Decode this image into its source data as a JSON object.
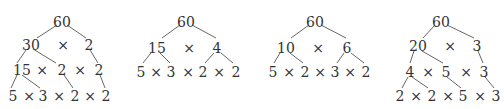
{
  "diagram": {
    "title": "",
    "colors": {
      "text": "#333333",
      "lines": "#555555",
      "background": "#ffffff"
    },
    "times_symbol": "×",
    "trees": [
      {
        "root": {
          "label": "60",
          "x": 62,
          "y": 22
        },
        "rows": [
          {
            "y": 45,
            "items": [
              {
                "t": "30",
                "x": 31
              },
              {
                "t": "×",
                "x": 63,
                "op": true
              },
              {
                "t": "2",
                "x": 89
              }
            ]
          },
          {
            "y": 70,
            "items": [
              {
                "t": "15",
                "x": 22
              },
              {
                "t": "×",
                "x": 42,
                "op": true
              },
              {
                "t": "2",
                "x": 62
              },
              {
                "t": "×",
                "x": 80,
                "op": true
              },
              {
                "t": "2",
                "x": 99
              }
            ]
          },
          {
            "y": 96,
            "items": [
              {
                "t": "5",
                "x": 13
              },
              {
                "t": "×",
                "x": 29,
                "op": true
              },
              {
                "t": "3",
                "x": 43
              },
              {
                "t": "×",
                "x": 59,
                "op": true
              },
              {
                "t": "2",
                "x": 75
              },
              {
                "t": "×",
                "x": 90,
                "op": true
              },
              {
                "t": "2",
                "x": 106
              }
            ]
          }
        ],
        "edges": [
          [
            57,
            25,
            37,
            38
          ],
          [
            67,
            25,
            86,
            38
          ],
          [
            26,
            50,
            17,
            63
          ],
          [
            33,
            49,
            56,
            63
          ],
          [
            90,
            50,
            98,
            63
          ],
          [
            17,
            75,
            11,
            88
          ],
          [
            22,
            75,
            40,
            88
          ],
          [
            64,
            75,
            73,
            88
          ],
          [
            100,
            75,
            105,
            88
          ]
        ]
      },
      {
        "root": {
          "label": "60",
          "x": 186,
          "y": 22
        },
        "rows": [
          {
            "y": 48,
            "items": [
              {
                "t": "15",
                "x": 157
              },
              {
                "t": "×",
                "x": 189,
                "op": true
              },
              {
                "t": "4",
                "x": 217
              }
            ]
          },
          {
            "y": 72,
            "items": [
              {
                "t": "5",
                "x": 141
              },
              {
                "t": "×",
                "x": 156,
                "op": true
              },
              {
                "t": "3",
                "x": 171
              },
              {
                "t": "×",
                "x": 188,
                "op": true
              },
              {
                "t": "2",
                "x": 203
              },
              {
                "t": "×",
                "x": 219,
                "op": true
              },
              {
                "t": "2",
                "x": 236
              }
            ]
          }
        ],
        "edges": [
          [
            180,
            25,
            162,
            38
          ],
          [
            192,
            25,
            216,
            38
          ],
          [
            151,
            53,
            143,
            63
          ],
          [
            160,
            53,
            170,
            63
          ],
          [
            214,
            53,
            205,
            63
          ],
          [
            221,
            53,
            233,
            63
          ]
        ]
      },
      {
        "root": {
          "label": "60",
          "x": 315,
          "y": 22
        },
        "rows": [
          {
            "y": 48,
            "items": [
              {
                "t": "10",
                "x": 286
              },
              {
                "t": "×",
                "x": 318,
                "op": true
              },
              {
                "t": "6",
                "x": 347
              }
            ]
          },
          {
            "y": 72,
            "items": [
              {
                "t": "5",
                "x": 273
              },
              {
                "t": "×",
                "x": 289,
                "op": true
              },
              {
                "t": "2",
                "x": 305
              },
              {
                "t": "×",
                "x": 320,
                "op": true
              },
              {
                "t": "3",
                "x": 335
              },
              {
                "t": "×",
                "x": 350,
                "op": true
              },
              {
                "t": "2",
                "x": 366
              }
            ]
          }
        ],
        "edges": [
          [
            309,
            25,
            291,
            38
          ],
          [
            321,
            25,
            346,
            38
          ],
          [
            280,
            53,
            274,
            63
          ],
          [
            290,
            53,
            303,
            63
          ],
          [
            344,
            53,
            337,
            63
          ],
          [
            351,
            53,
            364,
            63
          ]
        ]
      },
      {
        "root": {
          "label": "60",
          "x": 441,
          "y": 22
        },
        "rows": [
          {
            "y": 46,
            "items": [
              {
                "t": "20",
                "x": 418
              },
              {
                "t": "×",
                "x": 450,
                "op": true
              },
              {
                "t": "3",
                "x": 477
              }
            ]
          },
          {
            "y": 72,
            "items": [
              {
                "t": "4",
                "x": 410
              },
              {
                "t": "×",
                "x": 428,
                "op": true
              },
              {
                "t": "5",
                "x": 446
              },
              {
                "t": "×",
                "x": 466,
                "op": true
              },
              {
                "t": "3",
                "x": 484
              }
            ]
          },
          {
            "y": 96,
            "items": [
              {
                "t": "2",
                "x": 400
              },
              {
                "t": "×",
                "x": 416,
                "op": true
              },
              {
                "t": "2",
                "x": 432
              },
              {
                "t": "×",
                "x": 448,
                "op": true
              },
              {
                "t": "5",
                "x": 463
              },
              {
                "t": "×",
                "x": 480,
                "op": true
              },
              {
                "t": "3",
                "x": 496
              }
            ]
          }
        ],
        "edges": [
          [
            435,
            25,
            423,
            38
          ],
          [
            447,
            25,
            474,
            38
          ],
          [
            414,
            51,
            410,
            63
          ],
          [
            422,
            51,
            443,
            63
          ],
          [
            478,
            51,
            483,
            63
          ],
          [
            408,
            77,
            402,
            88
          ],
          [
            412,
            77,
            428,
            88
          ],
          [
            447,
            77,
            461,
            88
          ],
          [
            485,
            77,
            494,
            88
          ]
        ]
      }
    ]
  }
}
